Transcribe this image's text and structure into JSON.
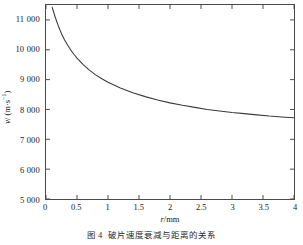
{
  "chart_data": {
    "type": "line",
    "title": "",
    "xlabel": "r/mm",
    "ylabel": "v/ (m·s⁻¹)",
    "xlim": [
      0,
      4
    ],
    "ylim": [
      5000,
      11500
    ],
    "grid": false,
    "legend": null,
    "xticks": [
      "0",
      "0.5",
      "1",
      "1.5",
      "2",
      "2.5",
      "3",
      "3.5",
      "4"
    ],
    "xtick_values": [
      0,
      0.5,
      1,
      1.5,
      2,
      2.5,
      3,
      3.5,
      4
    ],
    "yticks": [
      "5 000",
      "6 000",
      "7 000",
      "8 000",
      "9 000",
      "10 000",
      "11 000"
    ],
    "ytick_values": [
      5000,
      6000,
      7000,
      8000,
      9000,
      10000,
      11000
    ],
    "series": [
      {
        "name": "fragment velocity",
        "x": [
          0.1,
          0.15,
          0.2,
          0.25,
          0.3,
          0.35,
          0.4,
          0.45,
          0.5,
          0.6,
          0.7,
          0.8,
          0.9,
          1.0,
          1.2,
          1.4,
          1.6,
          1.8,
          2.0,
          2.2,
          2.4,
          2.6,
          2.8,
          3.0,
          3.2,
          3.4,
          3.6,
          3.8,
          4.0
        ],
        "values": [
          11420,
          11080,
          10790,
          10540,
          10330,
          10150,
          9990,
          9850,
          9720,
          9500,
          9320,
          9160,
          9030,
          8910,
          8720,
          8560,
          8430,
          8320,
          8220,
          8140,
          8070,
          8000,
          7950,
          7900,
          7860,
          7820,
          7780,
          7750,
          7720
        ]
      }
    ]
  },
  "axes": {
    "y_title_var": "v",
    "y_title_unit": "/ (m·s",
    "y_title_exp": "−1",
    "y_title_tail": ")",
    "x_title_var": "r",
    "x_title_unit": "/mm"
  },
  "caption": {
    "number": "图 4",
    "text": "破片速度衰减与距离的关系"
  },
  "style": {
    "curve_color": "#3c3c3c",
    "axis_color": "#4a4a4a",
    "text_color": "#1a1a1a",
    "background": "#ffffff"
  }
}
